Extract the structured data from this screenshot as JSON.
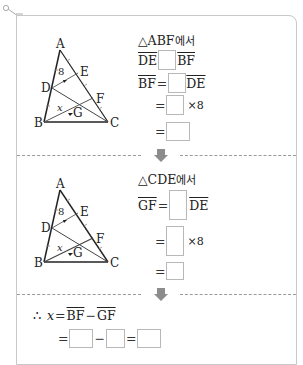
{
  "step1": {
    "heading_tri": "△ABF",
    "heading_suffix": "에서",
    "line1": {
      "left": "DE",
      "right": "BF"
    },
    "line2": {
      "left": "BF",
      "eq": "=",
      "right": "DE"
    },
    "line3": {
      "eq": "=",
      "times": "×8"
    },
    "line4": {
      "eq": "="
    },
    "triangle_labels": {
      "A": "A",
      "B": "B",
      "C": "C",
      "D": "D",
      "E": "E",
      "F": "F",
      "G": "G",
      "de_value": "8",
      "bg_value": "x"
    }
  },
  "step2": {
    "heading_tri": "△CDE",
    "heading_suffix": "에서",
    "line1": {
      "left": "GF",
      "eq": "=",
      "right": "DE"
    },
    "line2": {
      "eq": "=",
      "times": "×8"
    },
    "line3": {
      "eq": "="
    },
    "triangle_labels": {
      "A": "A",
      "B": "B",
      "C": "C",
      "D": "D",
      "E": "E",
      "F": "F",
      "G": "G",
      "de_value": "8",
      "bg_value": "x"
    }
  },
  "conclusion": {
    "therefore": "∴",
    "var": "x",
    "eq": "=",
    "term1": "BF",
    "minus": "−",
    "term2": "GF",
    "line2": {
      "eq1": "=",
      "minus": "−",
      "eq2": "="
    }
  },
  "colors": {
    "border": "#c8c8c8",
    "arrow": "#8c8c8c",
    "dash": "#9a9a9a",
    "box_border": "#b8b8b8"
  }
}
